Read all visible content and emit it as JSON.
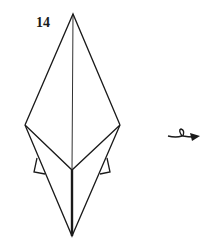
{
  "diagram": {
    "step_number": "14",
    "instruction_symbol": "turn-over-icon",
    "colors": {
      "line": "#1a1a1a",
      "background": "#ffffff"
    }
  }
}
